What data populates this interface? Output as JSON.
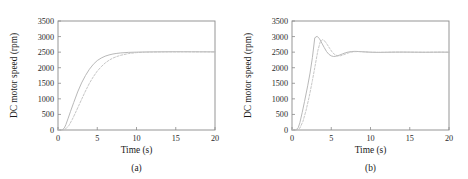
{
  "figure": {
    "panel_count": 2
  },
  "chart_data": [
    {
      "type": "line",
      "title": "",
      "caption": "(a)",
      "xlabel": "Time (s)",
      "ylabel": "DC motor speed (rpm)",
      "xlim": [
        0,
        20
      ],
      "ylim": [
        0,
        3500
      ],
      "xticks": [
        0,
        5,
        10,
        15,
        20
      ],
      "yticks": [
        0,
        500,
        1000,
        1500,
        2000,
        2500,
        3000,
        3500
      ],
      "xtick_labels": [
        "0",
        "5",
        "10",
        "15",
        "20"
      ],
      "ytick_labels": [
        "0",
        "500",
        "1000",
        "1500",
        "2000",
        "2500",
        "3000",
        "3500"
      ],
      "grid": false,
      "legend": "none",
      "steady_state": 2500,
      "series": [
        {
          "name": "solid-response",
          "style": "solid",
          "color": "#b4b4b4",
          "x": [
            0,
            0.5,
            0.8,
            1.0,
            1.3,
            1.6,
            2.0,
            2.5,
            3.0,
            3.5,
            4.0,
            4.5,
            5.0,
            5.5,
            6.0,
            6.5,
            7.0,
            7.5,
            8.0,
            9.0,
            10.0,
            11.0,
            12.0,
            13.0,
            14.0,
            15.0,
            16.0,
            17.0,
            18.0,
            19.0,
            20.0
          ],
          "y": [
            0,
            0,
            60,
            170,
            380,
            600,
            880,
            1220,
            1510,
            1750,
            1950,
            2110,
            2230,
            2310,
            2370,
            2410,
            2440,
            2460,
            2475,
            2492,
            2500,
            2505,
            2508,
            2510,
            2512,
            2513,
            2513,
            2512,
            2511,
            2510,
            2508
          ]
        },
        {
          "name": "dashed-response",
          "style": "dashed",
          "color": "#c0c0c0",
          "x": [
            0,
            0.6,
            1.0,
            1.4,
            1.8,
            2.2,
            2.6,
            3.0,
            3.5,
            4.0,
            4.5,
            5.0,
            5.5,
            6.0,
            6.5,
            7.0,
            7.5,
            8.0,
            9.0,
            10.0,
            11.0,
            12.0,
            13.0,
            14.0,
            15.0,
            16.0,
            17.0,
            18.0,
            19.0,
            20.0
          ],
          "y": [
            0,
            0,
            40,
            150,
            330,
            540,
            760,
            980,
            1250,
            1500,
            1710,
            1890,
            2030,
            2150,
            2240,
            2310,
            2360,
            2400,
            2455,
            2485,
            2498,
            2504,
            2507,
            2509,
            2510,
            2510,
            2510,
            2509,
            2508,
            2507
          ]
        }
      ]
    },
    {
      "type": "line",
      "title": "",
      "caption": "(b)",
      "xlabel": "Time (s)",
      "ylabel": "DC motor speed (rpm)",
      "xlim": [
        0,
        20
      ],
      "ylim": [
        0,
        3500
      ],
      "xticks": [
        0,
        5,
        10,
        15,
        20
      ],
      "yticks": [
        0,
        500,
        1000,
        1500,
        2000,
        2500,
        3000,
        3500
      ],
      "xtick_labels": [
        "0",
        "5",
        "10",
        "15",
        "20"
      ],
      "ytick_labels": [
        "0",
        "500",
        "1000",
        "1500",
        "2000",
        "2500",
        "3000",
        "3500"
      ],
      "grid": false,
      "legend": "none",
      "steady_state": 2500,
      "overshoot_peak": 3020,
      "overshoot_time": 2.9,
      "series": [
        {
          "name": "solid-response",
          "style": "solid",
          "color": "#b4b4b4",
          "x": [
            0,
            0.5,
            0.8,
            1.0,
            1.3,
            1.6,
            2.0,
            2.3,
            2.6,
            2.9,
            3.2,
            3.5,
            3.8,
            4.1,
            4.4,
            4.7,
            5.0,
            5.3,
            5.6,
            6.0,
            6.4,
            6.8,
            7.2,
            7.6,
            8.0,
            8.5,
            9.0,
            10.0,
            11.0,
            12.0,
            13.0,
            14.0,
            15.0,
            16.0,
            17.0,
            18.0,
            19.0,
            20.0
          ],
          "y": [
            0,
            0,
            80,
            230,
            560,
            920,
            1420,
            1830,
            2330,
            2960,
            3010,
            2930,
            2790,
            2650,
            2520,
            2430,
            2380,
            2360,
            2370,
            2400,
            2440,
            2480,
            2505,
            2520,
            2525,
            2520,
            2512,
            2498,
            2492,
            2496,
            2500,
            2502,
            2500,
            2498,
            2496,
            2498,
            2500,
            2498
          ]
        },
        {
          "name": "dashed-response",
          "style": "dashed",
          "color": "#c0c0c0",
          "x": [
            0,
            0.6,
            1.0,
            1.4,
            1.8,
            2.2,
            2.6,
            3.0,
            3.3,
            3.6,
            3.9,
            4.2,
            4.5,
            4.8,
            5.1,
            5.4,
            5.8,
            6.2,
            6.6,
            7.0,
            7.5,
            8.0,
            8.5,
            9.0,
            10.0,
            11.0,
            12.0,
            13.0,
            14.0,
            15.0,
            16.0,
            17.0,
            18.0,
            19.0,
            20.0
          ],
          "y": [
            0,
            0,
            60,
            280,
            640,
            1080,
            1590,
            2140,
            2560,
            2830,
            2900,
            2850,
            2740,
            2620,
            2510,
            2430,
            2380,
            2385,
            2420,
            2460,
            2500,
            2515,
            2518,
            2512,
            2498,
            2492,
            2496,
            2500,
            2501,
            2499,
            2497,
            2497,
            2499,
            2500,
            2499
          ]
        }
      ]
    }
  ]
}
